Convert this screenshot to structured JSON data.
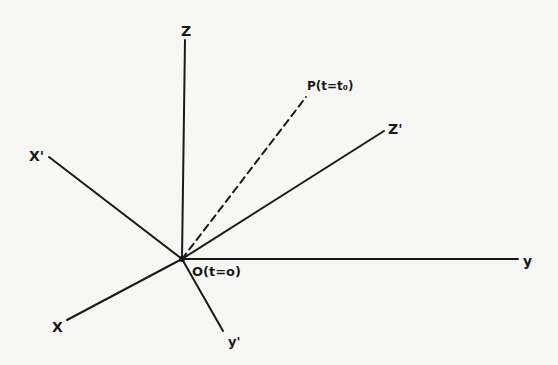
{
  "diagram": {
    "type": "coordinate-frames",
    "origin": {
      "label": "O(t=o)",
      "x": 182,
      "y": 259
    },
    "axes": [
      {
        "id": "Z",
        "label": "Z",
        "end": [
          185,
          40
        ],
        "label_pos": [
          181,
          36
        ],
        "style": "solid"
      },
      {
        "id": "Zprime",
        "label": "Z'",
        "end": [
          384,
          131
        ],
        "label_pos": [
          388,
          134
        ],
        "style": "solid"
      },
      {
        "id": "Xprime",
        "label": "X'",
        "end": [
          49,
          157
        ],
        "label_pos": [
          29,
          161
        ],
        "style": "solid"
      },
      {
        "id": "y",
        "label": "y",
        "end": [
          518,
          259
        ],
        "label_pos": [
          523,
          266
        ],
        "style": "solid"
      },
      {
        "id": "X",
        "label": "X",
        "end": [
          67,
          320
        ],
        "label_pos": [
          52,
          332
        ],
        "style": "solid"
      },
      {
        "id": "yprime",
        "label": "y'",
        "end": [
          223,
          331
        ],
        "label_pos": [
          228,
          346
        ],
        "style": "solid"
      },
      {
        "id": "P",
        "label": "P(t=t₀)",
        "end": [
          306,
          97
        ],
        "label_pos": [
          307,
          90
        ],
        "style": "dashed"
      }
    ],
    "colors": {
      "ink": "#1a1a1a",
      "paper": "#f7f7f5"
    }
  }
}
